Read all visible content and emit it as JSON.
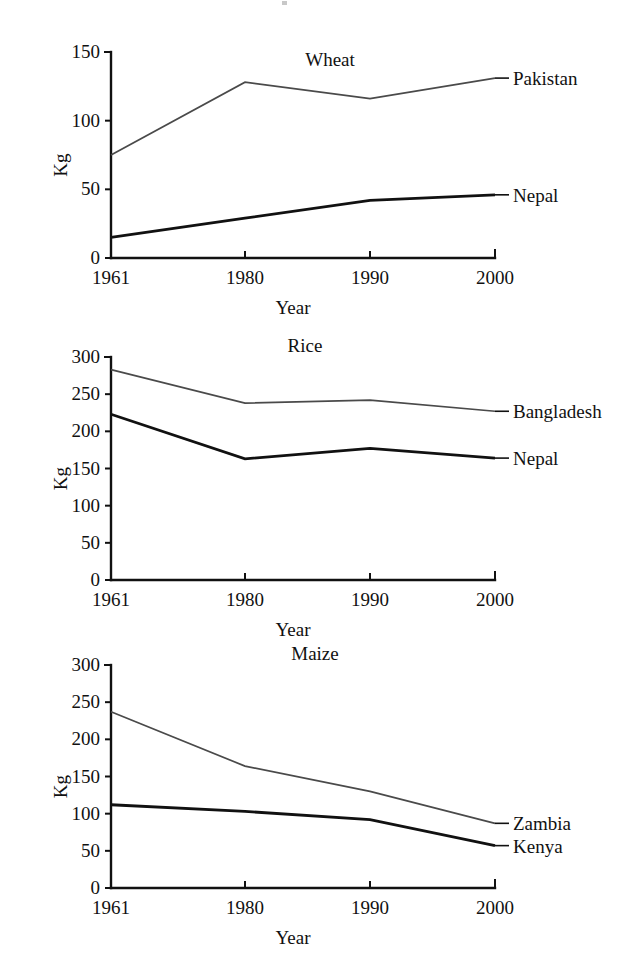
{
  "figure": {
    "axis_y_label": "Kg",
    "axis_x_label": "Year"
  },
  "chart_data": [
    {
      "type": "line",
      "title": "Wheat",
      "xlabel": "Year",
      "ylabel": "Kg",
      "categories": [
        "1961",
        "1980",
        "1990",
        "2000"
      ],
      "x": [
        1961,
        1980,
        1990,
        2000
      ],
      "ylim": [
        0,
        150
      ],
      "yticks": [
        0,
        50,
        100,
        150
      ],
      "grid": false,
      "legend": "right-inline-labels",
      "series": [
        {
          "name": "Pakistan",
          "style": "thin",
          "values": [
            75,
            128,
            116,
            131
          ]
        },
        {
          "name": "Nepal",
          "style": "thick",
          "values": [
            15,
            29,
            42,
            46
          ]
        }
      ]
    },
    {
      "type": "line",
      "title": "Rice",
      "xlabel": "Year",
      "ylabel": "Kg",
      "categories": [
        "1961",
        "1980",
        "1990",
        "2000"
      ],
      "x": [
        1961,
        1980,
        1990,
        2000
      ],
      "ylim": [
        0,
        300
      ],
      "yticks": [
        0,
        50,
        100,
        150,
        200,
        250,
        300
      ],
      "grid": false,
      "legend": "right-inline-labels",
      "series": [
        {
          "name": "Bangladesh",
          "style": "thin",
          "values": [
            283,
            238,
            242,
            227
          ]
        },
        {
          "name": "Nepal",
          "style": "thick",
          "values": [
            223,
            163,
            177,
            164
          ]
        }
      ]
    },
    {
      "type": "line",
      "title": "Maize",
      "xlabel": "Year",
      "ylabel": "Kg",
      "categories": [
        "1961",
        "1980",
        "1990",
        "2000"
      ],
      "x": [
        1961,
        1980,
        1990,
        2000
      ],
      "ylim": [
        0,
        300
      ],
      "yticks": [
        0,
        50,
        100,
        150,
        200,
        250,
        300
      ],
      "grid": false,
      "legend": "right-inline-labels",
      "series": [
        {
          "name": "Zambia",
          "style": "thin",
          "values": [
            237,
            164,
            130,
            87
          ]
        },
        {
          "name": "Kenya",
          "style": "thick",
          "values": [
            112,
            103,
            92,
            57
          ]
        }
      ]
    }
  ]
}
